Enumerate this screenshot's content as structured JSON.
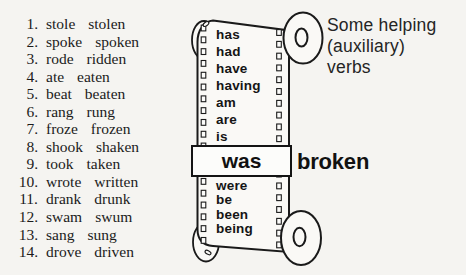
{
  "palette": {
    "page_bg": "#f5f4f1",
    "ink": "#1b1b1b",
    "line_color": "#1a1a1a",
    "strip_fill": "#faf9f6",
    "box_fill": "#fcfcfa"
  },
  "verb_list": {
    "items": [
      {
        "num": "1.",
        "past": "stole",
        "participle": "stolen"
      },
      {
        "num": "2.",
        "past": "spoke",
        "participle": "spoken"
      },
      {
        "num": "3.",
        "past": "rode",
        "participle": "ridden"
      },
      {
        "num": "4.",
        "past": "ate",
        "participle": "eaten"
      },
      {
        "num": "5.",
        "past": "beat",
        "participle": "beaten"
      },
      {
        "num": "6.",
        "past": "rang",
        "participle": "rung"
      },
      {
        "num": "7.",
        "past": "froze",
        "participle": "frozen"
      },
      {
        "num": "8.",
        "past": "shook",
        "participle": "shaken"
      },
      {
        "num": "9.",
        "past": "took",
        "participle": "taken"
      },
      {
        "num": "10.",
        "past": "wrote",
        "participle": "written"
      },
      {
        "num": "11.",
        "past": "drank",
        "participle": "drunk"
      },
      {
        "num": "12.",
        "past": "swam",
        "participle": "swum"
      },
      {
        "num": "13.",
        "past": "sang",
        "participle": "sung"
      },
      {
        "num": "14.",
        "past": "drove",
        "participle": "driven"
      }
    ]
  },
  "filmstrip": {
    "upper_words": [
      "has",
      "had",
      "have",
      "having",
      "am",
      "are",
      "is"
    ],
    "highlight_word": "was",
    "result_word": "broken",
    "lower_words": [
      "were",
      "be",
      "been",
      "being"
    ]
  },
  "caption": {
    "line1": "Some helping",
    "line2": "(auxiliary)",
    "line3": "verbs"
  }
}
